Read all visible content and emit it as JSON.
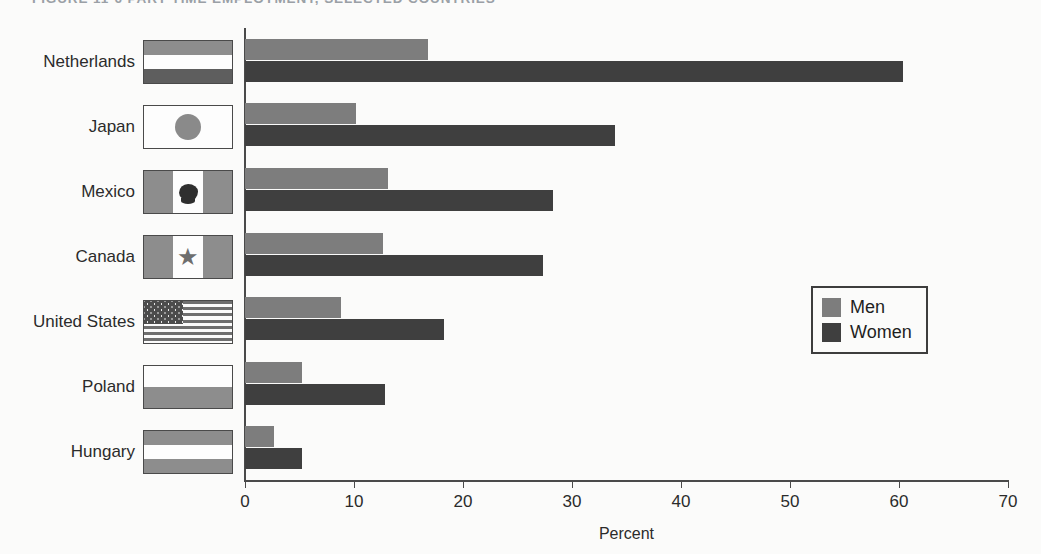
{
  "figure": {
    "title": "FIGURE 11-6   PART-TIME EMPLOYMENT, SELECTED COUNTRIES"
  },
  "chart_data": {
    "type": "bar",
    "orientation": "horizontal",
    "title": "FIGURE 11-6   PART-TIME EMPLOYMENT, SELECTED COUNTRIES",
    "xlabel": "Percent",
    "ylabel": "",
    "xlim": [
      0,
      70
    ],
    "xticks": [
      0,
      10,
      20,
      30,
      40,
      50,
      60,
      70
    ],
    "grid": false,
    "legend_position": "center-right",
    "categories": [
      "Netherlands",
      "Japan",
      "Mexico",
      "Canada",
      "United States",
      "Poland",
      "Hungary"
    ],
    "series": [
      {
        "name": "Men",
        "color": "#7d7d7d",
        "values": [
          16.8,
          10.2,
          13.1,
          12.7,
          8.8,
          5.2,
          2.7
        ]
      },
      {
        "name": "Women",
        "color": "#3f3f3f",
        "values": [
          60.4,
          33.9,
          28.3,
          27.3,
          18.3,
          12.8,
          5.2
        ]
      }
    ]
  },
  "axis": {
    "x_title": "Percent",
    "tick_labels": [
      "0",
      "10",
      "20",
      "30",
      "40",
      "50",
      "60",
      "70"
    ]
  },
  "legend": {
    "entries": [
      {
        "label": "Men",
        "color": "#7d7d7d"
      },
      {
        "label": "Women",
        "color": "#3f3f3f"
      }
    ]
  },
  "flags": {
    "netherlands": "flag-netherlands",
    "japan": "flag-japan",
    "mexico": "flag-mexico",
    "canada": "flag-canada",
    "united_states": "flag-united-states",
    "poland": "flag-poland",
    "hungary": "flag-hungary"
  }
}
